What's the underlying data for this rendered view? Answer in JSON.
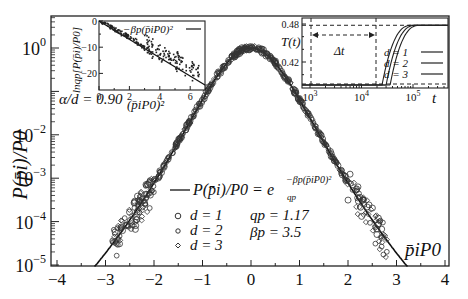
{
  "chart_data": [
    {
      "panel": "main",
      "type": "scatter",
      "title": "",
      "xlabel": "p̄_i P_0",
      "ylabel": "P(p̄_i)/P_0",
      "xlim": [
        -4,
        4
      ],
      "ylim": [
        1e-05,
        2
      ],
      "yscale": "log",
      "grid": false,
      "xticks": [
        -4,
        -3,
        -2,
        -1,
        0,
        1,
        2,
        3,
        4
      ],
      "xtick_labels": [
        "−4",
        "−3",
        "−2",
        "−1",
        "0",
        "1",
        "2",
        "3",
        "4"
      ],
      "yticks": [
        1,
        0.01,
        0.001,
        0.0001,
        1e-05
      ],
      "ytick_labels": [
        "10^0",
        "10^-2",
        "10^-3",
        "10^-4",
        "10^-5"
      ],
      "annotation": "α/d = 0.90",
      "fit": {
        "label": "P(p̄_i)/P_0 = e_{q_p}^{−β_p (p̄_i P_0)^2}",
        "q_p": 1.17,
        "beta_p": 3.5
      },
      "params_text": [
        "q_p = 1.17",
        "β_p = 3.5"
      ],
      "legend": [
        "d = 1",
        "d = 2",
        "d = 3"
      ],
      "series": [
        {
          "name": "d = 1",
          "marker": "circle"
        },
        {
          "name": "d = 2",
          "marker": "small-circle"
        },
        {
          "name": "d = 3",
          "marker": "diamond"
        }
      ]
    },
    {
      "panel": "inset-left",
      "type": "scatter",
      "xlabel": "(p̄_i P_0)^2",
      "ylabel": "ln_{q_p}[P(p̄_i)/P_0]",
      "xlim": [
        0,
        7
      ],
      "ylim": [
        -25,
        0
      ],
      "xticks": [
        0,
        2,
        4,
        6
      ],
      "yticks": [
        0,
        -10,
        -20
      ],
      "legend": [
        "−β_p (p̄_i P_0)^2"
      ],
      "line": {
        "x": [
          0,
          7
        ],
        "y": [
          0,
          -24.5
        ]
      }
    },
    {
      "panel": "inset-right",
      "type": "line",
      "xlabel": "t",
      "ylabel": "T(t)",
      "xscale": "log",
      "xlim": [
        700,
        300000
      ],
      "ylim": [
        0.39,
        0.485
      ],
      "xticks": [
        1000,
        10000,
        100000
      ],
      "xtick_labels": [
        "10^3",
        "10^4",
        "10^5"
      ],
      "yticks": [
        0.48,
        0.42
      ],
      "annotation": "Δt",
      "legend": [
        "d = 1",
        "d = 2",
        "d = 3"
      ],
      "series": [
        {
          "name": "d = 1",
          "rise_start": 25000,
          "plateau": 0.478
        },
        {
          "name": "d = 2",
          "rise_start": 30000,
          "plateau": 0.478
        },
        {
          "name": "d = 3",
          "rise_start": 36000,
          "plateau": 0.478
        }
      ]
    }
  ],
  "labels": {
    "ylabel_main": "P(p̄i)/P0",
    "alpha_d": "α/d = 0.90",
    "xlabel_main": "p̄iP0",
    "fit_label": "P(p̄i)/P0 = e",
    "q_p": "qp = 1.17",
    "beta_p": "βp = 3.5",
    "legend_d1": "d = 1",
    "legend_d2": "d = 2",
    "legend_d3": "d = 3",
    "inset_left_legend": "−βp(p̄iP0)²",
    "inset_left_xlabel": "(p̄iP0)²",
    "inset_left_ylabel": "lnqp[P(p̄i)/P0]",
    "inset_right_ylabel": "T(t)",
    "inset_right_xlabel": "t",
    "delta_t": "Δt"
  }
}
